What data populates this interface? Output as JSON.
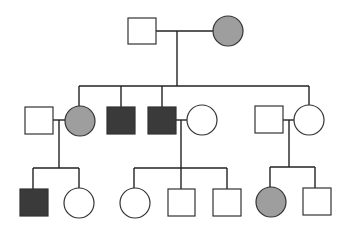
{
  "diagram": {
    "type": "pedigree",
    "colors": {
      "unaffected": "#ffffff",
      "affected_female_gray": "#9e9e9e",
      "affected_male_dark": "#3a3a3a",
      "line": "#222222"
    },
    "generations": [
      {
        "label": "I",
        "individuals": [
          {
            "id": "I-1",
            "sex": "male",
            "status": "unaffected"
          },
          {
            "id": "I-2",
            "sex": "female",
            "status": "affected-gray"
          }
        ]
      },
      {
        "label": "II",
        "individuals": [
          {
            "id": "II-1",
            "sex": "male",
            "status": "unaffected",
            "note": "spouse"
          },
          {
            "id": "II-2",
            "sex": "female",
            "status": "affected-gray"
          },
          {
            "id": "II-3",
            "sex": "male",
            "status": "affected-dark"
          },
          {
            "id": "II-4",
            "sex": "male",
            "status": "affected-dark"
          },
          {
            "id": "II-5",
            "sex": "female",
            "status": "unaffected",
            "note": "spouse"
          },
          {
            "id": "II-6",
            "sex": "male",
            "status": "unaffected",
            "note": "spouse"
          },
          {
            "id": "II-7",
            "sex": "female",
            "status": "unaffected"
          }
        ]
      },
      {
        "label": "III",
        "individuals": [
          {
            "id": "III-1",
            "sex": "male",
            "status": "affected-dark"
          },
          {
            "id": "III-2",
            "sex": "female",
            "status": "unaffected"
          },
          {
            "id": "III-3",
            "sex": "female",
            "status": "unaffected"
          },
          {
            "id": "III-4",
            "sex": "male",
            "status": "unaffected"
          },
          {
            "id": "III-5",
            "sex": "male",
            "status": "unaffected"
          },
          {
            "id": "III-6",
            "sex": "female",
            "status": "affected-gray"
          },
          {
            "id": "III-7",
            "sex": "male",
            "status": "unaffected"
          }
        ]
      }
    ]
  }
}
